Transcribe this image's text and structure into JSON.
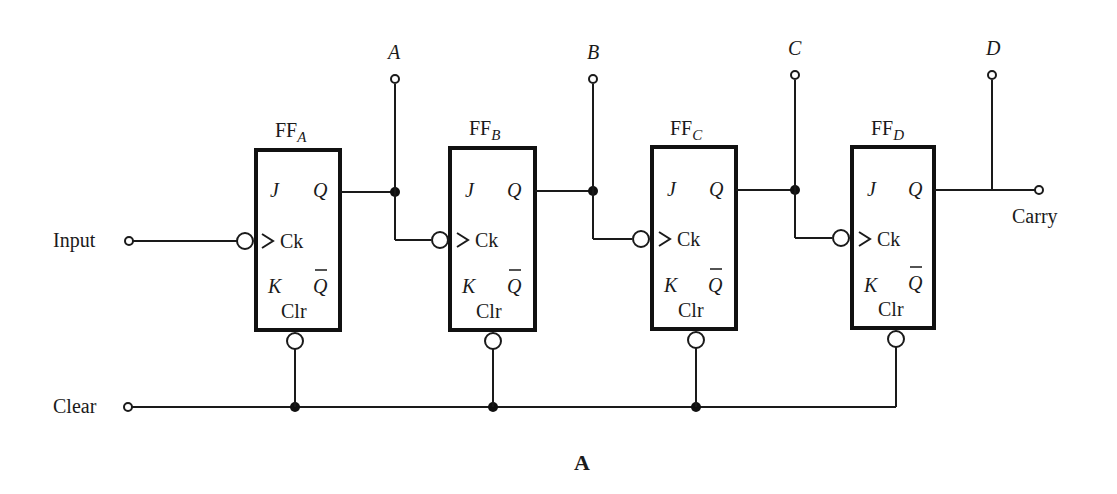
{
  "diagram": {
    "type": "4-bit ripple counter (JK flip-flops)",
    "caption": "A",
    "inputs": {
      "input_label": "Input",
      "clear_label": "Clear"
    },
    "carry_label": "Carry",
    "flip_flops": [
      {
        "name_main": "FF",
        "name_sub": "A",
        "output_label": "A",
        "pin_j": "J",
        "pin_q": "Q",
        "pin_ck": "Ck",
        "pin_k": "K",
        "pin_qbar": "Q",
        "pin_clr": "Clr"
      },
      {
        "name_main": "FF",
        "name_sub": "B",
        "output_label": "B",
        "pin_j": "J",
        "pin_q": "Q",
        "pin_ck": "Ck",
        "pin_k": "K",
        "pin_qbar": "Q",
        "pin_clr": "Clr"
      },
      {
        "name_main": "FF",
        "name_sub": "C",
        "output_label": "C",
        "pin_j": "J",
        "pin_q": "Q",
        "pin_ck": "Ck",
        "pin_k": "K",
        "pin_qbar": "Q",
        "pin_clr": "Clr"
      },
      {
        "name_main": "FF",
        "name_sub": "D",
        "output_label": "D",
        "pin_j": "J",
        "pin_q": "Q",
        "pin_ck": "Ck",
        "pin_k": "K",
        "pin_qbar": "Q",
        "pin_clr": "Clr"
      }
    ],
    "colors": {
      "ink": "#1a1a1a",
      "background": "#ffffff"
    }
  }
}
